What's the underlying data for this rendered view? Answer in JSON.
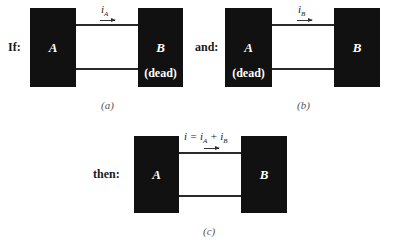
{
  "panels": {
    "a": {
      "prefix": "If:",
      "caption": "(a)",
      "box_left": {
        "label": "A",
        "status": ""
      },
      "box_right": {
        "label": "B",
        "status": "(dead)"
      },
      "current": {
        "symbol": "i",
        "subscript": "A"
      }
    },
    "b": {
      "prefix": "and:",
      "caption": "(b)",
      "box_left": {
        "label": "A",
        "status": "(dead)"
      },
      "box_right": {
        "label": "B",
        "status": ""
      },
      "current": {
        "symbol": "i",
        "subscript": "B"
      }
    },
    "c": {
      "prefix": "then:",
      "caption": "(c)",
      "box_left": {
        "label": "A"
      },
      "box_right": {
        "label": "B"
      },
      "current": {
        "lhs": "i = i",
        "sub1": "A",
        "plus": " + i",
        "sub2": "B"
      }
    }
  }
}
